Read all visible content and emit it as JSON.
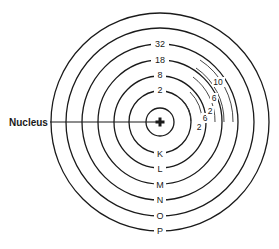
{
  "diagram": {
    "type": "atomic-shell-model",
    "nucleus": {
      "label": "Nucleus",
      "symbol": "+"
    },
    "shells": [
      {
        "letter": "K",
        "capacity": "2"
      },
      {
        "letter": "L",
        "capacity": "8"
      },
      {
        "letter": "M",
        "capacity": "18"
      },
      {
        "letter": "N",
        "capacity": "32"
      },
      {
        "letter": "O",
        "capacity": ""
      },
      {
        "letter": "P",
        "capacity": ""
      }
    ],
    "subshell_labels": {
      "L": [
        "2",
        "6"
      ],
      "M": [
        "2",
        "6",
        "10"
      ]
    },
    "colors": {
      "line": "#1a1a1a",
      "background": "#ffffff"
    }
  }
}
